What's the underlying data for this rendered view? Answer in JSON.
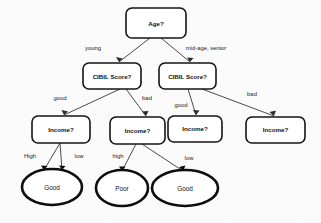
{
  "diagram": {
    "type": "decision-tree",
    "background_color": "#fcfcfc",
    "node_stroke_color": "#151515",
    "leaf_stroke_color": "#0d0d0d",
    "edge_color": "#2a2a2a",
    "text_color": "#111111"
  },
  "nodes": [
    {
      "id": "root",
      "label": "Age?",
      "shape": "rounded-rect",
      "x": 155,
      "y": 23,
      "w": 60,
      "h": 30
    },
    {
      "id": "cibil-l",
      "label": "CIBIL Score?",
      "shape": "rounded-rect",
      "x": 111,
      "y": 76,
      "w": 58,
      "h": 26
    },
    {
      "id": "cibil-r",
      "label": "CIBIL Score?",
      "shape": "rounded-rect",
      "x": 187,
      "y": 76,
      "w": 58,
      "h": 26
    },
    {
      "id": "income-1",
      "label": "Income?",
      "shape": "rounded-rect",
      "x": 61,
      "y": 129,
      "w": 58,
      "h": 27
    },
    {
      "id": "income-2",
      "label": "Income?",
      "shape": "rounded-rect",
      "x": 137,
      "y": 130,
      "w": 55,
      "h": 27
    },
    {
      "id": "income-3",
      "label": "Income?",
      "shape": "rounded-rect",
      "x": 195,
      "y": 129,
      "w": 55,
      "h": 26
    },
    {
      "id": "income-4",
      "label": "Income?",
      "shape": "rounded-rect",
      "x": 275,
      "y": 130,
      "w": 60,
      "h": 26
    }
  ],
  "leaves": [
    {
      "id": "leaf-good-1",
      "label": "Good",
      "shape": "ellipse",
      "cx": 52,
      "cy": 187,
      "rx": 30,
      "ry": 18
    },
    {
      "id": "leaf-poor",
      "label": "Poor",
      "shape": "ellipse",
      "cx": 122,
      "cy": 188,
      "rx": 26,
      "ry": 18
    },
    {
      "id": "leaf-good-2",
      "label": "Good",
      "shape": "ellipse",
      "cx": 185,
      "cy": 188,
      "rx": 33,
      "ry": 18
    }
  ],
  "edges": [
    {
      "id": "e-root-left",
      "from": "root",
      "to": "cibil-l",
      "x1": 148,
      "y1": 38,
      "x2": 118,
      "y2": 63,
      "label": "young",
      "lx": 93,
      "ly": 48
    },
    {
      "id": "e-root-right",
      "from": "root",
      "to": "cibil-r",
      "x1": 163,
      "y1": 38,
      "x2": 192,
      "y2": 63,
      "label": "mid-age, senior",
      "lx": 205,
      "ly": 48
    },
    {
      "id": "e-cibill-good",
      "from": "cibil-l",
      "to": "income-1",
      "x1": 118,
      "y1": 89,
      "x2": 64,
      "y2": 116,
      "label": "good",
      "lx": 60,
      "ly": 98
    },
    {
      "id": "e-cibill-bad",
      "from": "cibil-l",
      "to": "income-2",
      "x1": 124,
      "y1": 89,
      "x2": 147,
      "y2": 117,
      "label": "bad",
      "lx": 147,
      "ly": 98
    },
    {
      "id": "e-cibilr-good",
      "from": "cibil-r",
      "to": "income-3",
      "x1": 186,
      "y1": 89,
      "x2": 196,
      "y2": 116,
      "label": "good",
      "lx": 181,
      "ly": 104
    },
    {
      "id": "e-cibilr-bad",
      "from": "cibil-r",
      "to": "income-4",
      "x1": 198,
      "y1": 89,
      "x2": 276,
      "y2": 117,
      "label": "bad",
      "lx": 252,
      "ly": 94
    },
    {
      "id": "e-inc1-high",
      "from": "income-1",
      "to": "leaf-good-1",
      "x1": 61,
      "y1": 143,
      "x2": 43,
      "y2": 170,
      "label": "High",
      "lx": 31,
      "ly": 156
    },
    {
      "id": "e-inc1-low",
      "from": "income-1",
      "to": "leaf-good-1",
      "x1": 61,
      "y1": 143,
      "x2": 62,
      "y2": 170,
      "label": "low",
      "lx": 79,
      "ly": 156
    },
    {
      "id": "e-inc2-high",
      "from": "income-2",
      "to": "leaf-poor",
      "x1": 137,
      "y1": 144,
      "x2": 122,
      "y2": 171,
      "label": "high",
      "lx": 118,
      "ly": 156
    },
    {
      "id": "e-inc2-low",
      "from": "income-2",
      "to": "leaf-good-2",
      "x1": 143,
      "y1": 144,
      "x2": 184,
      "y2": 171,
      "label": "low",
      "lx": 189,
      "ly": 158
    },
    {
      "id": "e-inc3-in",
      "from": "cibil-r",
      "to": "income-3",
      "x1": 186,
      "y1": 89,
      "x2": 196,
      "y2": 116,
      "label": "",
      "lx": 0,
      "ly": 0
    }
  ],
  "edge_labels": {
    "young": "young",
    "mid_age_senior": "mid-age, senior",
    "good_left": "good",
    "bad_left": "bad",
    "good_right": "good",
    "bad_right": "bad",
    "high_cap": "High",
    "low_1": "low",
    "high_2": "high",
    "low_2": "low"
  },
  "node_labels": {
    "age": "Age?",
    "cibil_left": "CIBIL Score?",
    "cibil_right": "CIBIL Score?",
    "income_1": "Income?",
    "income_2": "Income?",
    "income_3": "Income?",
    "income_4": "Income?"
  },
  "leaf_labels": {
    "good_1": "Good",
    "poor": "Poor",
    "good_2": "Good"
  }
}
